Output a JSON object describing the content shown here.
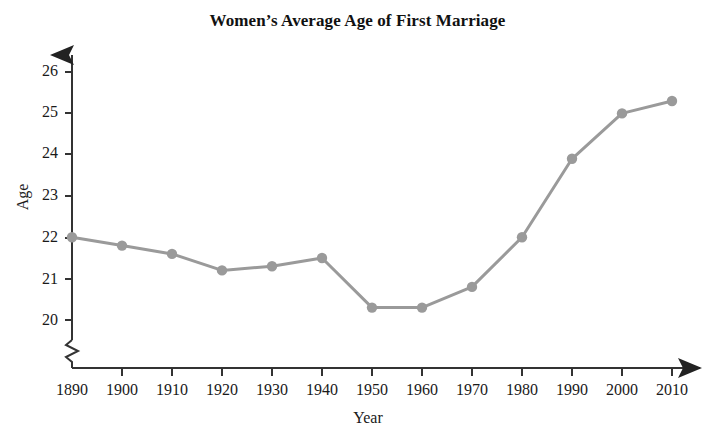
{
  "chart_data": {
    "type": "line",
    "title": "Women’s Average Age of First Marriage",
    "xlabel": "Year",
    "ylabel": "Age",
    "categories": [
      1890,
      1900,
      1910,
      1920,
      1930,
      1940,
      1950,
      1960,
      1970,
      1980,
      1990,
      2000,
      2010
    ],
    "x_tick_labels": [
      "1890",
      "1900",
      "1910",
      "1920",
      "1930",
      "1940",
      "1950",
      "1960",
      "1970",
      "1980",
      "1990",
      "2000",
      "2010"
    ],
    "y_tick_labels": [
      "20",
      "21",
      "22",
      "23",
      "24",
      "25",
      "26"
    ],
    "y_ticks": [
      20,
      21,
      22,
      23,
      24,
      25,
      26
    ],
    "values": [
      22.0,
      21.8,
      21.6,
      21.2,
      21.3,
      21.5,
      20.3,
      20.3,
      20.8,
      22.0,
      23.9,
      25.0,
      25.3
    ],
    "series": [
      {
        "name": "Women’s average age of first marriage",
        "values": [
          22.0,
          21.8,
          21.6,
          21.2,
          21.3,
          21.5,
          20.3,
          20.3,
          20.8,
          22.0,
          23.9,
          25.0,
          25.3
        ]
      }
    ],
    "xlim": [
      1890,
      2010
    ],
    "ylim": [
      19.6,
      26.4
    ],
    "grid": false,
    "legend": false,
    "y_axis_break": true,
    "marker": "circle",
    "line_color": "#9a9a9a",
    "marker_color": "#9a9a9a",
    "axis_color": "#333333"
  },
  "labels": {
    "title": "Women’s Average Age of First Marriage",
    "x_axis_title": "Year",
    "y_axis_title": "Age"
  }
}
